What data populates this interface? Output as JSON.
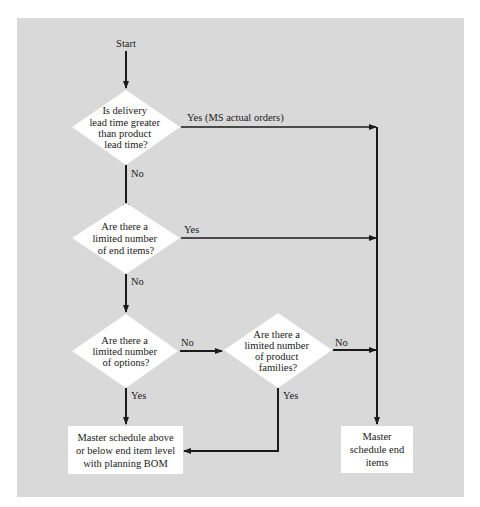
{
  "diagram": {
    "start_label": "Start",
    "decisions": [
      {
        "id": "d1",
        "lines": [
          "Is delivery",
          "lead time greater",
          "than product",
          "lead time?"
        ]
      },
      {
        "id": "d2",
        "lines": [
          "Are there a",
          "limited number",
          "of end items?"
        ]
      },
      {
        "id": "d3",
        "lines": [
          "Are there a",
          "limited number",
          "of options?"
        ]
      },
      {
        "id": "d4",
        "lines": [
          "Are there a",
          "limited number",
          "of product",
          "families?"
        ]
      }
    ],
    "edges": {
      "d1_yes": "Yes (MS actual orders)",
      "d1_no": "No",
      "d2_yes": "Yes",
      "d2_no": "No",
      "d3_no": "No",
      "d3_yes": "Yes",
      "d4_no": "No",
      "d4_yes": "Yes"
    },
    "outcomes": {
      "planning_bom": "Master schedule above or below end item level with planning BOM",
      "end_items": "Master schedule end items"
    },
    "colors": {
      "panel": "#d9d9d9",
      "shape_fill": "#ffffff",
      "line": "#1a1a1a"
    }
  }
}
